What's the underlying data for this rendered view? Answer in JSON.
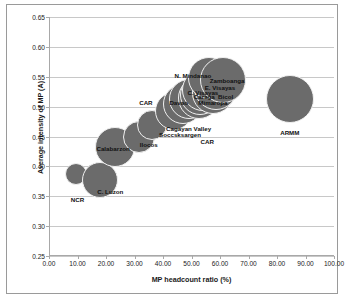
{
  "chart_data": {
    "type": "scatter",
    "title": "",
    "xlabel": "MP headcount ratio (%)",
    "ylabel": "Average intensity of MP (A)",
    "xlim": [
      0,
      100
    ],
    "ylim": [
      0.25,
      0.65
    ],
    "xticks": [
      "0.00",
      "10.00",
      "20.00",
      "30.00",
      "40.00",
      "50.00",
      "60.00",
      "70.00",
      "80.00",
      "90.00",
      "100.00"
    ],
    "xtick_values": [
      0,
      10,
      20,
      30,
      40,
      50,
      60,
      70,
      80,
      90,
      100
    ],
    "yticks": [
      "0.25",
      "0.30",
      "0.35",
      "0.40",
      "0.45",
      "0.50",
      "0.55",
      "0.60",
      "0.65"
    ],
    "ytick_values": [
      0.25,
      0.3,
      0.35,
      0.4,
      0.45,
      0.5,
      0.55,
      0.6,
      0.65
    ],
    "grid": true,
    "legend": "none",
    "bubble_color": "#6b6b6b",
    "points": [
      {
        "label": "NCR",
        "x": 9.5,
        "y": 0.388,
        "size": 22
      },
      {
        "label": "C. Luzon",
        "x": 18.0,
        "y": 0.378,
        "size": 36
      },
      {
        "label": "Calabarzon",
        "x": 23.0,
        "y": 0.432,
        "size": 40
      },
      {
        "label": "Ilocos",
        "x": 31.5,
        "y": 0.45,
        "size": 32
      },
      {
        "label": "CAR",
        "x": 36.0,
        "y": 0.47,
        "size": 30
      },
      {
        "label": "Cagayan Valley",
        "x": 44.0,
        "y": 0.492,
        "size": 38
      },
      {
        "label": "Soccsksargen",
        "x": 47.0,
        "y": 0.505,
        "size": 40
      },
      {
        "label": "Davao",
        "x": 49.0,
        "y": 0.512,
        "size": 40
      },
      {
        "label": "Mimaropa",
        "x": 52.5,
        "y": 0.515,
        "size": 42
      },
      {
        "label": "Caraga",
        "x": 53.0,
        "y": 0.52,
        "size": 40
      },
      {
        "label": "C. Visayas",
        "x": 54.0,
        "y": 0.528,
        "size": 42
      },
      {
        "label": "Bicol",
        "x": 57.5,
        "y": 0.522,
        "size": 42
      },
      {
        "label": "E. Visayas",
        "x": 58.5,
        "y": 0.532,
        "size": 44
      },
      {
        "label": "N. Mindanao",
        "x": 56.0,
        "y": 0.548,
        "size": 42
      },
      {
        "label": "Zamboanga",
        "x": 61.0,
        "y": 0.545,
        "size": 46
      },
      {
        "label": "ARMM",
        "x": 84.5,
        "y": 0.512,
        "size": 48
      }
    ],
    "annotations": [
      {
        "text": "N. Mindanao",
        "x": 50.5,
        "y": 0.553
      },
      {
        "text": "Zamboanga",
        "x": 62.5,
        "y": 0.545
      },
      {
        "text": "E. Visayas",
        "x": 60.0,
        "y": 0.533
      },
      {
        "text": "C. Visayas",
        "x": 54.0,
        "y": 0.525
      },
      {
        "text": "Caraga",
        "x": 54.5,
        "y": 0.517
      },
      {
        "text": "Bicol",
        "x": 62.0,
        "y": 0.517
      },
      {
        "text": "Davao",
        "x": 45.5,
        "y": 0.508
      },
      {
        "text": "Mimaropa",
        "x": 57.5,
        "y": 0.508
      },
      {
        "text": "CAR",
        "x": 34.0,
        "y": 0.508
      },
      {
        "text": "Cagayan Valley",
        "x": 49.0,
        "y": 0.464
      },
      {
        "text": "Soccsksargen",
        "x": 46.0,
        "y": 0.455
      },
      {
        "text": "CAR",
        "x": 55.5,
        "y": 0.442
      },
      {
        "text": "Ilocos",
        "x": 35.0,
        "y": 0.437
      },
      {
        "text": "Calabarzon",
        "x": 22.5,
        "y": 0.43
      },
      {
        "text": "C. Luzon",
        "x": 21.5,
        "y": 0.358
      },
      {
        "text": "NCR",
        "x": 10.0,
        "y": 0.345
      },
      {
        "text": "ARMM",
        "x": 84.5,
        "y": 0.458
      }
    ]
  }
}
